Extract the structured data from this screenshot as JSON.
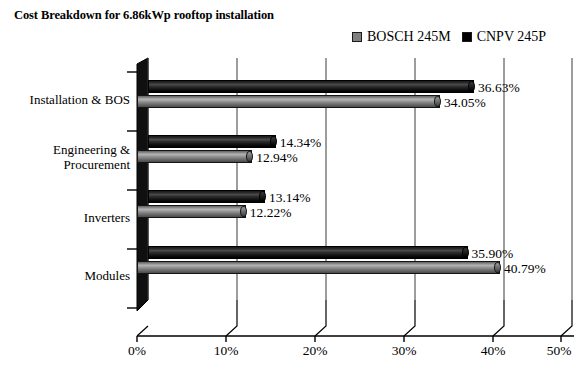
{
  "chart_data": {
    "type": "bar",
    "orientation": "horizontal",
    "title": "Cost Breakdown for 6.86kWp rooftop installation",
    "xlabel": "",
    "ylabel": "",
    "xlim": [
      0,
      50
    ],
    "xticks": [
      "0%",
      "10%",
      "20%",
      "30%",
      "40%",
      "50%"
    ],
    "xtick_values": [
      0,
      10,
      20,
      30,
      40,
      50
    ],
    "grid": true,
    "legend_position": "top-right",
    "categories": [
      "Installation & BOS",
      "Engineering &\nProcurement",
      "Inverters",
      "Modules"
    ],
    "series": [
      {
        "name": "BOSCH 245M",
        "color": "#808080",
        "values": [
          34.05,
          12.94,
          12.22,
          40.79
        ],
        "labels": [
          "34.05%",
          "12.94%",
          "12.22%",
          "40.79%"
        ]
      },
      {
        "name": "CNPV 245P",
        "color": "#000000",
        "values": [
          36.63,
          14.34,
          13.14,
          35.9
        ],
        "labels": [
          "36.63%",
          "14.34%",
          "13.14%",
          "35.90%"
        ]
      }
    ]
  },
  "legend": {
    "entries": [
      {
        "label": "BOSCH 245M",
        "swatch": "#808080"
      },
      {
        "label": "CNPV 245P",
        "swatch": "#000000"
      }
    ]
  },
  "axis": {
    "tick_labels": [
      "0%",
      "10%",
      "20%",
      "30%",
      "40%",
      "50%"
    ]
  },
  "category_labels": [
    "Installation & BOS",
    "Engineering &\nProcurement",
    "Inverters",
    "Modules"
  ],
  "data_labels": {
    "installation_bos": {
      "cnpv": "36.63%",
      "bosch": "34.05%"
    },
    "engineering_procurement": {
      "cnpv": "14.34%",
      "bosch": "12.94%"
    },
    "inverters": {
      "cnpv": "13.14%",
      "bosch": "12.22%"
    },
    "modules": {
      "cnpv": "35.90%",
      "bosch": "40.79%"
    }
  }
}
